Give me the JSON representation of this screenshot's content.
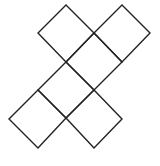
{
  "diagram": {
    "stroke_color": "#222222",
    "background": "#ffffff",
    "squares": [
      {
        "name": "top-left",
        "points": "66,5 94,33 66,62 38,33"
      },
      {
        "name": "top-right",
        "points": "122,5 150,33 122,62 94,33"
      },
      {
        "name": "center-upper",
        "points": "94,33 122,62 94,90 66,62"
      },
      {
        "name": "center-lower",
        "points": "66,62 94,90 66,118 38,90"
      },
      {
        "name": "bottom-left",
        "points": "38,90 66,118 38,148 9,119"
      },
      {
        "name": "bottom-right",
        "points": "94,90 122,119 94,148 66,118"
      }
    ]
  }
}
